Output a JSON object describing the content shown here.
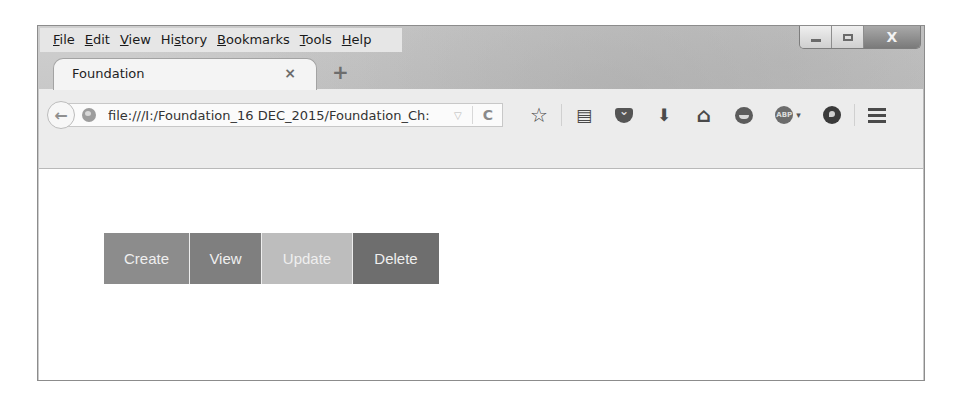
{
  "menubar": {
    "items": [
      {
        "label_u": "F",
        "label_rest": "ile"
      },
      {
        "label_u": "E",
        "label_rest": "dit"
      },
      {
        "label_u": "V",
        "label_rest": "iew"
      },
      {
        "label_pre": "Hi",
        "label_u": "s",
        "label_rest": "tory"
      },
      {
        "label_u": "B",
        "label_rest": "ookmarks"
      },
      {
        "label_u": "T",
        "label_rest": "ools"
      },
      {
        "label_u": "H",
        "label_rest": "elp"
      }
    ]
  },
  "window_controls": {
    "minimize": "minimize",
    "maximize": "maximize",
    "close_glyph": "X"
  },
  "tab": {
    "title": "Foundation",
    "close_glyph": "×",
    "new_tab_glyph": "+"
  },
  "navbar": {
    "back_glyph": "←",
    "url": "file:///I:/Foundation_16 DEC_2015/Foundation_Ch:",
    "dropmark_glyph": "▽",
    "reload_glyph": "C",
    "icons": {
      "bookmark_star": "☆",
      "reading_list": "▤",
      "download": "⬇",
      "home": "⌂",
      "abp_label": "ABP",
      "abp_caret": "▾"
    }
  },
  "buttons": [
    {
      "label": "Create",
      "color": "#8c8c8c",
      "width": 86
    },
    {
      "label": "View",
      "color": "#7f7f7f",
      "width": 72
    },
    {
      "label": "Update",
      "color": "#bdbdbd",
      "width": 91
    },
    {
      "label": "Delete",
      "color": "#6e6e6e",
      "width": 86
    }
  ]
}
